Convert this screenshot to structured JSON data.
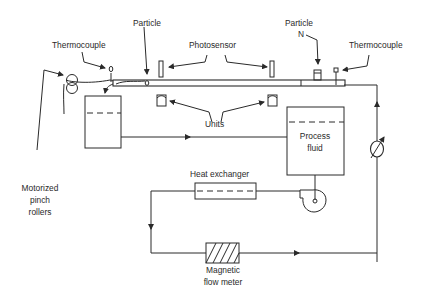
{
  "diagram": {
    "title": "",
    "labels": {
      "thermocouple_left": "Thermocouple",
      "particle_top": "Particle",
      "photosensor": "Photosensor",
      "particle_n_line1": "Particle",
      "particle_n_line2": "N",
      "thermocouple_right": "Thermocouple",
      "units": "Units",
      "process_fluid_line1": "Process",
      "process_fluid_line2": "fluid",
      "motorized_line1": "Motorized",
      "motorized_line2": "pinch",
      "motorized_line3": "rollers",
      "heat_exchanger": "Heat exchanger",
      "flow_meter_line1": "Magnetic",
      "flow_meter_line2": "flow meter"
    },
    "components": [
      {
        "id": "pinch-rollers",
        "name": "Motorized pinch rollers"
      },
      {
        "id": "thermocouple-inlet",
        "name": "Thermocouple"
      },
      {
        "id": "holding-tube",
        "name": "Holding tube"
      },
      {
        "id": "particle",
        "name": "Particle"
      },
      {
        "id": "photosensor-1",
        "name": "Photosensor"
      },
      {
        "id": "photosensor-2",
        "name": "Photosensor"
      },
      {
        "id": "units-1",
        "name": "Units"
      },
      {
        "id": "units-2",
        "name": "Units"
      },
      {
        "id": "particle-n",
        "name": "Particle N"
      },
      {
        "id": "thermocouple-outlet",
        "name": "Thermocouple"
      },
      {
        "id": "collection-tank",
        "name": "Collection tank"
      },
      {
        "id": "process-fluid-tank",
        "name": "Process fluid"
      },
      {
        "id": "valve",
        "name": "Adjustable valve"
      },
      {
        "id": "pump",
        "name": "Pump"
      },
      {
        "id": "heat-exchanger",
        "name": "Heat exchanger"
      },
      {
        "id": "flow-meter",
        "name": "Magnetic flow meter"
      }
    ],
    "connections": [
      {
        "from": "process-fluid-tank",
        "to": "pump"
      },
      {
        "from": "pump",
        "to": "heat-exchanger"
      },
      {
        "from": "heat-exchanger",
        "to": "flow-meter"
      },
      {
        "from": "flow-meter",
        "to": "valve"
      },
      {
        "from": "valve",
        "to": "holding-tube"
      },
      {
        "from": "collection-tank",
        "to": "process-fluid-tank"
      }
    ]
  }
}
